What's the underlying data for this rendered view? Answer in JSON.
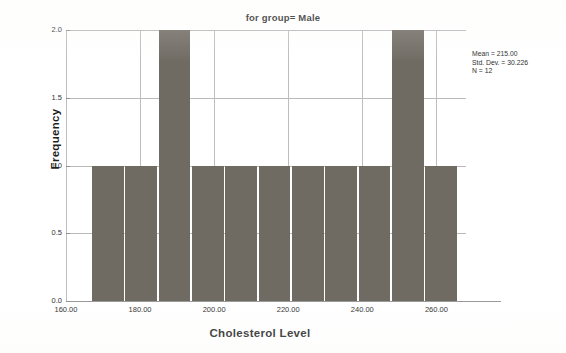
{
  "chart_data": {
    "type": "bar",
    "title": "for group= Male",
    "xlabel": "Cholesterol Level",
    "ylabel": "Frequency",
    "xlim": [
      160,
      268
    ],
    "ylim": [
      0,
      2
    ],
    "grid": true,
    "legend": "none",
    "xticks": [
      "160.00",
      "180.00",
      "200.00",
      "220.00",
      "240.00",
      "260.00"
    ],
    "xtick_values": [
      160,
      180,
      200,
      220,
      240,
      260
    ],
    "yticks": [
      "0.0",
      "0.5",
      "1.0",
      "1.5",
      "2.0"
    ],
    "ytick_values": [
      0,
      0.5,
      1,
      1.5,
      2
    ],
    "bin_width": 9,
    "categories": [
      "167-176",
      "176-185",
      "185-194",
      "194-203",
      "203-212",
      "212-221",
      "221-230",
      "230-239",
      "239-248",
      "248-257",
      "257-266"
    ],
    "bins": [
      {
        "start": 167,
        "end": 176,
        "value": 1
      },
      {
        "start": 176,
        "end": 185,
        "value": 1
      },
      {
        "start": 185,
        "end": 194,
        "value": 2
      },
      {
        "start": 194,
        "end": 203,
        "value": 1
      },
      {
        "start": 203,
        "end": 212,
        "value": 1
      },
      {
        "start": 212,
        "end": 221,
        "value": 1
      },
      {
        "start": 221,
        "end": 230,
        "value": 1
      },
      {
        "start": 230,
        "end": 239,
        "value": 1
      },
      {
        "start": 239,
        "end": 248,
        "value": 1
      },
      {
        "start": 248,
        "end": 257,
        "value": 2
      },
      {
        "start": 257,
        "end": 266,
        "value": 1
      }
    ],
    "values": [
      1,
      1,
      2,
      1,
      1,
      1,
      1,
      1,
      1,
      2,
      1
    ],
    "bar_color": "#6f6a62",
    "gridline_color": "#b9b9b9",
    "annotations": {
      "mean_label": "Mean = 215.00",
      "std_dev_label": "Std. Dev. = 30.226",
      "n_label": "N = 12"
    }
  },
  "statistics": {
    "mean": "Mean = 215.00",
    "std_dev": "Std. Dev. = 30.226",
    "n": "N = 12"
  }
}
